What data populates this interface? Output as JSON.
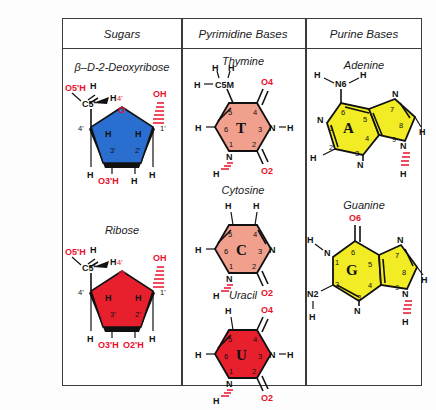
{
  "figure": {
    "background": "#fdfdfd",
    "border_color": "#3a3a3a"
  },
  "headers": {
    "sugars": "Sugars",
    "pyrimidine": "Pyrimidine Bases",
    "purine": "Purine Bases"
  },
  "colors": {
    "deoxyribose": "#2a6fd0",
    "ribose": "#e8202e",
    "pyrimidine_fill": "#f0a08c",
    "uracil_fill": "#e8202e",
    "purine_fill": "#f2ec24",
    "label_red": "#e8112d",
    "atom_black": "#111111"
  },
  "molecules": {
    "deoxyribose": {
      "title": "β–D-2-Deoxyribose",
      "labels": {
        "o5h": "O5'H",
        "c5": "C5'",
        "h_up1": "H",
        "h_up2": "H",
        "h_right": "H",
        "o4": "4'",
        "o_ring": "O",
        "c4": "4'",
        "c1": "1'",
        "h3i": "H",
        "h2i": "H",
        "c3": "3'",
        "c2": "2'",
        "oh_right": "OH",
        "h_left_down": "H",
        "o3h": "O3'H",
        "h_bottom": "H"
      }
    },
    "ribose": {
      "title": "Ribose",
      "labels": {
        "o5h": "O5'H",
        "c5": "C5'",
        "h_up1": "H",
        "h_up2": "H",
        "h_right": "H",
        "o4": "4'",
        "o_ring": "O",
        "c4": "4'",
        "c1": "1'",
        "h3i": "H",
        "h2i": "H",
        "c3": "3'",
        "c2": "2'",
        "oh_right": "OH",
        "h_left_down": "H",
        "o3h": "O3'H",
        "o2h": "O2'H"
      }
    },
    "thymine": {
      "title": "Thymine",
      "letter": "T",
      "labels": {
        "h_m1": "H",
        "h_m2": "H",
        "h_m3": "H",
        "c5m": "C5M",
        "o4": "O4",
        "o2": "O2",
        "n3": "N",
        "h_n3": "H",
        "n1": "N",
        "h_n1": "H",
        "h6": "H",
        "n5": "5",
        "n4": "4",
        "n6": "6",
        "n3num": "3",
        "n1num": "1",
        "n2num": "2"
      }
    },
    "cytosine": {
      "title": "Cytosine",
      "letter": "C",
      "labels": {
        "h_a1": "H",
        "h_a2": "H",
        "o2": "O2",
        "n3": "N",
        "n1": "N",
        "h_n1": "H",
        "h6": "H",
        "n5": "5",
        "n4": "4",
        "n6": "6",
        "n3num": "3",
        "n1num": "1",
        "n2num": "2"
      }
    },
    "uracil": {
      "title": "Uracil",
      "letter": "U",
      "labels": {
        "h5": "H",
        "o4": "O4",
        "o2": "O2",
        "n3": "N",
        "h_n3": "H",
        "n1": "N",
        "h_n1": "H",
        "h6": "H",
        "n5": "5",
        "n4": "4",
        "n6": "6",
        "n3num": "3",
        "n1num": "1",
        "n2num": "2"
      }
    },
    "adenine": {
      "title": "Adenine",
      "letter": "A",
      "labels": {
        "h_a1": "H",
        "h_a2": "H",
        "n6": "N6",
        "n1": "N",
        "n3": "N",
        "n7": "N",
        "n9": "N",
        "h2": "H",
        "h8": "H",
        "h_n9": "H",
        "num1": "1",
        "num2": "2",
        "num3": "3",
        "num4": "4",
        "num5": "5",
        "num6": "6",
        "num7": "7",
        "num8": "8",
        "num9": "9"
      }
    },
    "guanine": {
      "title": "Guanine",
      "letter": "G",
      "labels": {
        "o6": "O6",
        "n1": "N",
        "h_n1": "H",
        "n2": "N2",
        "h_n2a": "H",
        "h_n2b": "H",
        "n3": "N",
        "n7": "N",
        "n9": "N",
        "h8": "H",
        "h_n9": "H",
        "num1": "1",
        "num2": "2",
        "num3": "3",
        "num4": "4",
        "num5": "5",
        "num6": "6",
        "num7": "7",
        "num8": "8",
        "num9": "9"
      }
    }
  }
}
